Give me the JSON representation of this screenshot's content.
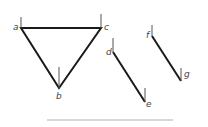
{
  "diagram": {
    "colors": {
      "edge": "#1a1a1a",
      "tick": "#555555",
      "label": "#444444",
      "baseline": "#b0b0b0"
    },
    "triangle": {
      "vertices": {
        "a": {
          "label": "a",
          "x": 21,
          "y": 28
        },
        "c": {
          "label": "c",
          "x": 101,
          "y": 28
        },
        "b": {
          "label": "b",
          "x": 59,
          "y": 88
        }
      }
    },
    "segment_de": {
      "start": {
        "label": "d",
        "x": 113,
        "y": 52
      },
      "end": {
        "label": "e",
        "x": 145,
        "y": 102
      }
    },
    "segment_fg": {
      "start": {
        "label": "f",
        "x": 152,
        "y": 36
      },
      "end": {
        "label": "g",
        "x": 181,
        "y": 81
      }
    },
    "baseline": {
      "x1": 47,
      "x2": 173,
      "y": 120
    }
  }
}
